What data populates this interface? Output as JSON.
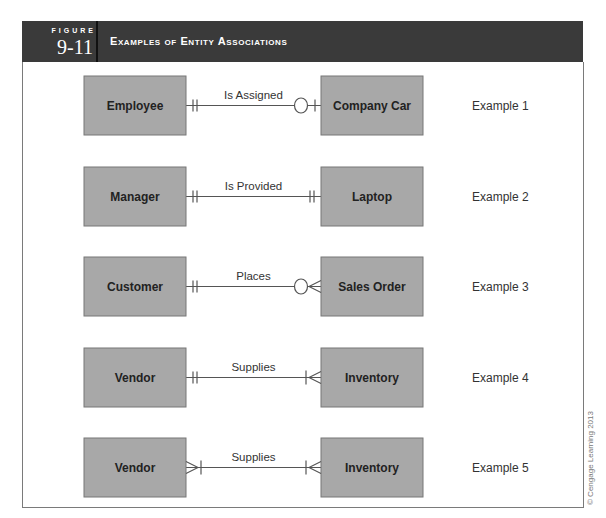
{
  "figure": {
    "label": "FIGURE",
    "number": "9-11",
    "title": "Examples of Entity Associations"
  },
  "colors": {
    "header_bg": "#3a3a3a",
    "entity_fill": "#a8a8a8",
    "entity_stroke": "#777777",
    "line": "#555555"
  },
  "examples": [
    {
      "left": "Employee",
      "relationship": "Is Assigned",
      "right": "Company Car",
      "label": "Example 1",
      "left_cardinality": "one-and-only-one",
      "right_cardinality": "zero-or-one"
    },
    {
      "left": "Manager",
      "relationship": "Is Provided",
      "right": "Laptop",
      "label": "Example 2",
      "left_cardinality": "one-and-only-one",
      "right_cardinality": "one-and-only-one"
    },
    {
      "left": "Customer",
      "relationship": "Places",
      "right": "Sales Order",
      "label": "Example 3",
      "left_cardinality": "one-and-only-one",
      "right_cardinality": "zero-or-many"
    },
    {
      "left": "Vendor",
      "relationship": "Supplies",
      "right": "Inventory",
      "label": "Example 4",
      "left_cardinality": "one-and-only-one",
      "right_cardinality": "one-or-many"
    },
    {
      "left": "Vendor",
      "relationship": "Supplies",
      "right": "Inventory",
      "label": "Example 5",
      "left_cardinality": "one-or-many",
      "right_cardinality": "one-or-many"
    }
  ],
  "copyright": "© Cengage Learning 2013"
}
